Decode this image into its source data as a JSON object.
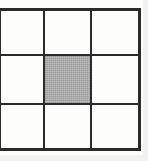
{
  "figure": {
    "kind": "grid-diagram",
    "rows": 3,
    "columns": 3,
    "line_color": "#2b2b2b",
    "cell_color": "#fdfdfc",
    "shaded_cell_color": "#ababab",
    "background_color": "#fdfdfc"
  },
  "grid": {
    "cells": [
      {
        "id": "r0c0",
        "row": 0,
        "column": 0,
        "state": "empty",
        "label": ""
      },
      {
        "id": "r0c1",
        "row": 0,
        "column": 1,
        "state": "empty",
        "label": ""
      },
      {
        "id": "r0c2",
        "row": 0,
        "column": 2,
        "state": "empty",
        "label": ""
      },
      {
        "id": "r1c0",
        "row": 1,
        "column": 0,
        "state": "empty",
        "label": ""
      },
      {
        "id": "r1c1",
        "row": 1,
        "column": 1,
        "state": "shaded",
        "label": ""
      },
      {
        "id": "r1c2",
        "row": 1,
        "column": 2,
        "state": "empty",
        "label": ""
      },
      {
        "id": "r2c0",
        "row": 2,
        "column": 0,
        "state": "empty",
        "label": ""
      },
      {
        "id": "r2c1",
        "row": 2,
        "column": 1,
        "state": "empty",
        "label": ""
      },
      {
        "id": "r2c2",
        "row": 2,
        "column": 2,
        "state": "empty",
        "label": ""
      }
    ],
    "shaded_cells": [
      "r1c1"
    ],
    "horizontal_rules": 4,
    "vertical_rules": 4
  }
}
